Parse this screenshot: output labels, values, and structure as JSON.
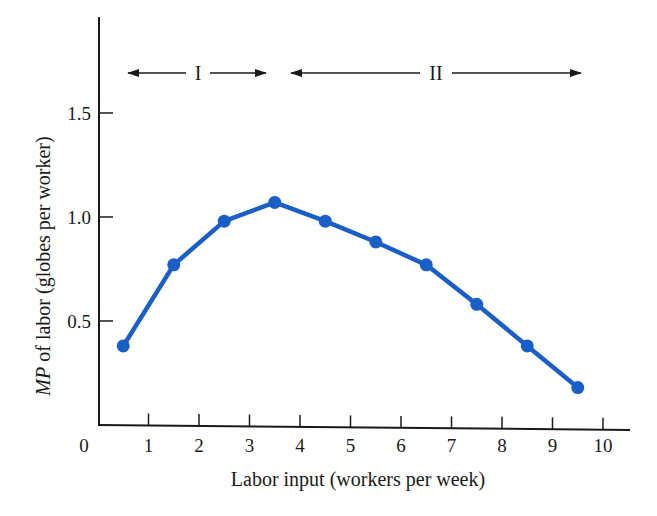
{
  "chart_data": {
    "type": "line",
    "title": "",
    "xlabel": "Labor input (workers per week)",
    "ylabel_italic": "MP",
    "ylabel_rest": " of labor (globes per worker)",
    "ylabel": "MP of labor (globes per worker)",
    "x_ticks": [
      "0",
      "1",
      "2",
      "3",
      "4",
      "5",
      "6",
      "7",
      "8",
      "9",
      "10"
    ],
    "y_ticks": [
      "0.5",
      "1.0",
      "1.5"
    ],
    "xlim": [
      0,
      10.5
    ],
    "ylim": [
      0,
      1.9
    ],
    "grid": false,
    "series": [
      {
        "name": "MP of labor",
        "color": "#1a5fc8",
        "x": [
          0.5,
          1.5,
          2.5,
          3.5,
          4.5,
          5.5,
          6.5,
          7.5,
          8.5,
          9.5
        ],
        "values": [
          0.38,
          0.77,
          0.98,
          1.07,
          0.98,
          0.88,
          0.77,
          0.58,
          0.38,
          0.18
        ]
      }
    ],
    "annotations": [
      {
        "label": "I",
        "type": "double-arrow",
        "x_start": 0.6,
        "x_end": 3.4,
        "y": 1.7
      },
      {
        "label": "II",
        "type": "double-arrow",
        "x_start": 3.8,
        "x_end": 9.6,
        "y": 1.7
      }
    ]
  }
}
